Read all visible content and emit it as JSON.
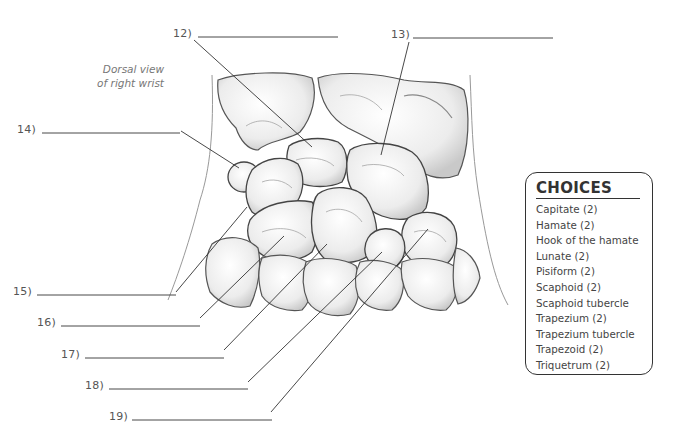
{
  "caption": {
    "line1": "Dorsal view",
    "line2": "of right wrist"
  },
  "labels": [
    {
      "number": "12)",
      "answer": ""
    },
    {
      "number": "13)",
      "answer": ""
    },
    {
      "number": "14)",
      "answer": ""
    },
    {
      "number": "15)",
      "answer": ""
    },
    {
      "number": "16)",
      "answer": ""
    },
    {
      "number": "17)",
      "answer": ""
    },
    {
      "number": "18)",
      "answer": ""
    },
    {
      "number": "19)",
      "answer": ""
    }
  ],
  "choices": {
    "title": "CHOICES",
    "items": [
      "Capitate (2)",
      "Hamate (2)",
      "Hook of the hamate",
      "Lunate (2)",
      "Pisiform (2)",
      "Scaphoid (2)",
      "Scaphoid tubercle",
      "Trapezium (2)",
      "Trapezium tubercle",
      "Trapezoid (2)",
      "Triquetrum (2)"
    ]
  },
  "colors": {
    "line": "#333333",
    "bone_stroke": "#444444",
    "bone_fill": "#f4f4f4",
    "bone_shade": "#d6d6d6"
  }
}
